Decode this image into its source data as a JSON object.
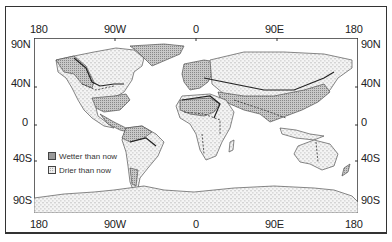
{
  "map": {
    "title": "",
    "x_axis": {
      "top_ticks": [
        "180",
        "90W",
        "0",
        "90E",
        "180"
      ],
      "bottom_ticks": [
        "180",
        "90W",
        "0",
        "90E",
        "180"
      ]
    },
    "y_axis": {
      "left_ticks": [
        "90N",
        "40N",
        "0",
        "40S",
        "90S"
      ],
      "right_ticks": [
        "90N",
        "40N",
        "0",
        "40S",
        "90S"
      ]
    },
    "legend": [
      {
        "label": "Wetter than now",
        "pattern": "dense-stipple",
        "color": "#9a9a9a"
      },
      {
        "label": "Drier than now",
        "pattern": "sparse-dash",
        "color": "#f0f0f0"
      }
    ],
    "colors": {
      "frame": "#333333",
      "land_outline": "#555555",
      "wetter_fill": "#b8b8b8",
      "drier_fill": "#f2f2f2",
      "boundary": "#222222"
    }
  }
}
